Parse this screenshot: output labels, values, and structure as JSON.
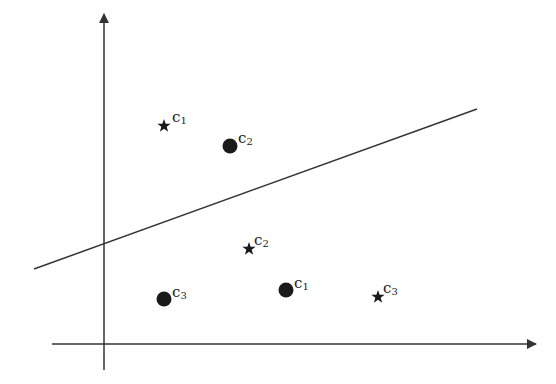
{
  "diagram": {
    "type": "classification-scatter",
    "axes": {
      "x_axis": {
        "y": 344,
        "x_start": 52,
        "x_end": 536
      },
      "y_axis": {
        "x": 104,
        "y_start": 370,
        "y_end": 14
      }
    },
    "separator_line": {
      "x1": 34,
      "y1": 269,
      "x2": 477,
      "y2": 109,
      "color": "#333333"
    },
    "points": [
      {
        "marker": "star",
        "x": 164,
        "y": 126,
        "label": "c",
        "sub": "1",
        "lx": 172,
        "ly": 110
      },
      {
        "marker": "circle",
        "x": 230,
        "y": 146,
        "label": "c",
        "sub": "2",
        "lx": 238,
        "ly": 131
      },
      {
        "marker": "star",
        "x": 249,
        "y": 249,
        "label": "c",
        "sub": "2",
        "lx": 254,
        "ly": 233
      },
      {
        "marker": "circle",
        "x": 164,
        "y": 299,
        "label": "c",
        "sub": "3",
        "lx": 172,
        "ly": 285
      },
      {
        "marker": "circle",
        "x": 286,
        "y": 290,
        "label": "c",
        "sub": "1",
        "lx": 294,
        "ly": 276
      },
      {
        "marker": "star",
        "x": 378,
        "y": 297,
        "label": "c",
        "sub": "3",
        "lx": 383,
        "ly": 281
      }
    ],
    "colors": {
      "axis": "#333333",
      "marker": "#1a1a1a",
      "text": "#222222"
    }
  }
}
